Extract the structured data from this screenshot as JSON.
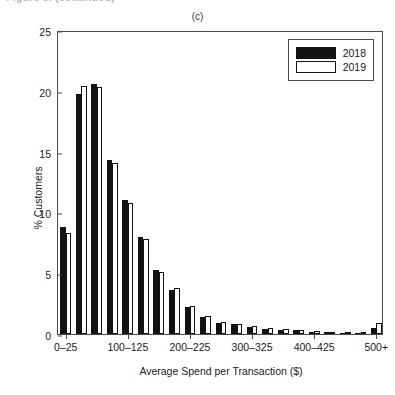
{
  "figure": {
    "cropped_caption": "Figure 3. (continued)",
    "panel_title": "(c)"
  },
  "legend": {
    "position": "top-right",
    "entries": [
      {
        "label": "2018",
        "color": "#121212",
        "style": "filled"
      },
      {
        "label": "2019",
        "color": "#ffffff",
        "style": "outlined"
      }
    ]
  },
  "chart_data": {
    "type": "bar",
    "title": "(c)",
    "xlabel": "Average Spend per Transaction ($)",
    "ylabel": "% Customers",
    "ylim": [
      0,
      25
    ],
    "yticks": [
      0,
      5,
      10,
      15,
      20,
      25
    ],
    "grid": false,
    "legend_position": "top-right",
    "categories": [
      "0–25",
      "25–50",
      "50–75",
      "75–100",
      "100–125",
      "125–150",
      "150–175",
      "175–200",
      "200–225",
      "225–250",
      "250–275",
      "275–300",
      "300–325",
      "325–350",
      "350–375",
      "375–400",
      "400–425",
      "425–450",
      "450–475",
      "475–500",
      "500+"
    ],
    "xtick_labels": [
      "0–25",
      "100–125",
      "200–225",
      "300–325",
      "400–425",
      "500+"
    ],
    "xtick_indices": [
      0,
      4,
      8,
      12,
      16,
      20
    ],
    "series": [
      {
        "name": "2018",
        "color": "#121212",
        "values": [
          8.8,
          19.7,
          20.6,
          14.3,
          11.0,
          8.0,
          5.3,
          3.6,
          2.2,
          1.4,
          0.9,
          0.8,
          0.6,
          0.45,
          0.35,
          0.3,
          0.2,
          0.18,
          0.12,
          0.1,
          0.5
        ]
      },
      {
        "name": "2019",
        "color": "#ffffff",
        "values": [
          8.3,
          20.4,
          20.3,
          14.1,
          10.8,
          7.8,
          5.1,
          3.8,
          2.3,
          1.5,
          1.0,
          0.85,
          0.65,
          0.5,
          0.4,
          0.3,
          0.25,
          0.2,
          0.15,
          0.12,
          0.9
        ]
      }
    ]
  }
}
